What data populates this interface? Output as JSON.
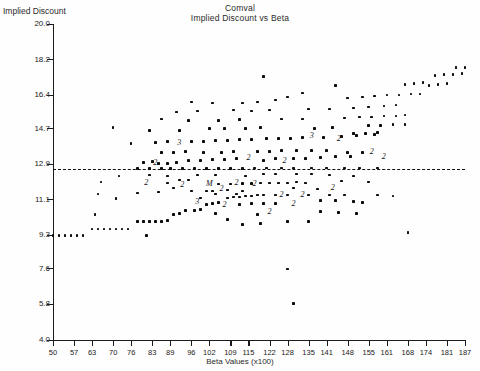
{
  "chart_data": {
    "type": "scatter",
    "title": "Comval",
    "subtitle": "Implied Discount vs Beta",
    "xlabel": "Beta Values (x100)",
    "ylabel": "Implied Discount",
    "xlim": [
      50,
      187
    ],
    "ylim": [
      4.0,
      20.0
    ],
    "grid": false,
    "legend": null,
    "xticks": [
      50,
      57,
      63,
      70,
      76,
      83,
      89,
      96,
      102,
      109,
      115,
      122,
      128,
      135,
      141,
      148,
      155,
      161,
      168,
      174,
      181,
      187
    ],
    "yticks": [
      "20.0",
      "18.2",
      "16.4",
      "14.7",
      "12.9",
      "11.1",
      "9.3",
      "7.6",
      "5.8",
      "4.0"
    ],
    "ytick_values": [
      20.0,
      18.2,
      16.4,
      14.7,
      12.9,
      11.1,
      9.3,
      7.6,
      5.8,
      4.0
    ],
    "reference_line": {
      "style": "dashed",
      "orientation": "horizontal",
      "y": 12.66
    },
    "overlap_markers": [
      {
        "x": 92,
        "y": 14.0,
        "label": "3"
      },
      {
        "x": 84,
        "y": 12.95,
        "label": "2"
      },
      {
        "x": 115,
        "y": 13.2,
        "label": "2"
      },
      {
        "x": 127,
        "y": 13.05,
        "label": "2"
      },
      {
        "x": 136,
        "y": 14.35,
        "label": "3"
      },
      {
        "x": 145,
        "y": 14.2,
        "label": "2"
      },
      {
        "x": 156,
        "y": 13.5,
        "label": "2"
      },
      {
        "x": 160,
        "y": 13.25,
        "label": "2"
      },
      {
        "x": 81,
        "y": 11.95,
        "label": "2"
      },
      {
        "x": 93,
        "y": 11.85,
        "label": "2"
      },
      {
        "x": 102,
        "y": 11.9,
        "label": "M"
      },
      {
        "x": 106,
        "y": 11.65,
        "label": "2"
      },
      {
        "x": 111,
        "y": 11.95,
        "label": "2"
      },
      {
        "x": 117,
        "y": 11.9,
        "label": "2"
      },
      {
        "x": 98,
        "y": 11.0,
        "label": "3"
      },
      {
        "x": 107,
        "y": 10.85,
        "label": "2"
      },
      {
        "x": 126,
        "y": 11.35,
        "label": "2"
      },
      {
        "x": 133,
        "y": 11.35,
        "label": "2"
      },
      {
        "x": 130,
        "y": 10.9,
        "label": "2"
      },
      {
        "x": 143,
        "y": 11.7,
        "label": "2"
      },
      {
        "x": 122,
        "y": 10.5,
        "label": "2"
      }
    ],
    "points": [
      {
        "x": 50,
        "y": 9.3
      },
      {
        "x": 52,
        "y": 9.3
      },
      {
        "x": 54,
        "y": 9.3
      },
      {
        "x": 56,
        "y": 9.3
      },
      {
        "x": 58,
        "y": 9.3
      },
      {
        "x": 60,
        "y": 9.3
      },
      {
        "x": 63,
        "y": 9.62
      },
      {
        "x": 65,
        "y": 9.62
      },
      {
        "x": 67,
        "y": 9.62
      },
      {
        "x": 69,
        "y": 9.62
      },
      {
        "x": 71,
        "y": 9.62
      },
      {
        "x": 73,
        "y": 9.62
      },
      {
        "x": 75,
        "y": 9.62
      },
      {
        "x": 78,
        "y": 10.0
      },
      {
        "x": 80,
        "y": 10.0
      },
      {
        "x": 82,
        "y": 10.0
      },
      {
        "x": 84,
        "y": 10.0
      },
      {
        "x": 86,
        "y": 10.0
      },
      {
        "x": 88,
        "y": 10.05
      },
      {
        "x": 81,
        "y": 9.3
      },
      {
        "x": 90,
        "y": 10.35
      },
      {
        "x": 92,
        "y": 10.4
      },
      {
        "x": 94,
        "y": 10.55
      },
      {
        "x": 97,
        "y": 10.55
      },
      {
        "x": 99,
        "y": 10.6
      },
      {
        "x": 101,
        "y": 10.85
      },
      {
        "x": 103,
        "y": 10.9
      },
      {
        "x": 105,
        "y": 10.95
      },
      {
        "x": 108,
        "y": 11.2
      },
      {
        "x": 110,
        "y": 11.25
      },
      {
        "x": 112,
        "y": 11.25
      },
      {
        "x": 114,
        "y": 11.3
      },
      {
        "x": 116,
        "y": 11.3
      },
      {
        "x": 118,
        "y": 11.35
      },
      {
        "x": 120,
        "y": 11.35
      },
      {
        "x": 104,
        "y": 11.4
      },
      {
        "x": 111,
        "y": 11.4
      },
      {
        "x": 71,
        "y": 11.15
      },
      {
        "x": 78,
        "y": 11.45
      },
      {
        "x": 96,
        "y": 11.55
      },
      {
        "x": 99,
        "y": 11.2
      },
      {
        "x": 88,
        "y": 11.95
      },
      {
        "x": 90,
        "y": 11.7
      },
      {
        "x": 101,
        "y": 11.55
      },
      {
        "x": 103,
        "y": 11.55
      },
      {
        "x": 108,
        "y": 11.6
      },
      {
        "x": 113,
        "y": 11.55
      },
      {
        "x": 105,
        "y": 11.9
      },
      {
        "x": 109,
        "y": 11.9
      },
      {
        "x": 113,
        "y": 11.92
      },
      {
        "x": 116,
        "y": 11.92
      },
      {
        "x": 119,
        "y": 11.95
      },
      {
        "x": 122,
        "y": 11.95
      },
      {
        "x": 125,
        "y": 11.95
      },
      {
        "x": 128,
        "y": 11.95
      },
      {
        "x": 131,
        "y": 12.0
      },
      {
        "x": 134,
        "y": 11.95
      },
      {
        "x": 138,
        "y": 11.65
      },
      {
        "x": 124,
        "y": 11.35
      },
      {
        "x": 128,
        "y": 11.35
      },
      {
        "x": 120,
        "y": 10.9
      },
      {
        "x": 124,
        "y": 10.9
      },
      {
        "x": 112,
        "y": 10.85
      },
      {
        "x": 116,
        "y": 10.9
      },
      {
        "x": 104,
        "y": 10.4
      },
      {
        "x": 130,
        "y": 11.7
      },
      {
        "x": 135,
        "y": 11.35
      },
      {
        "x": 142,
        "y": 11.35
      },
      {
        "x": 147,
        "y": 11.35
      },
      {
        "x": 139,
        "y": 11.05
      },
      {
        "x": 144,
        "y": 11.05
      },
      {
        "x": 150,
        "y": 11.0
      },
      {
        "x": 153,
        "y": 10.95
      },
      {
        "x": 118,
        "y": 10.35
      },
      {
        "x": 65,
        "y": 11.4
      },
      {
        "x": 85,
        "y": 11.5
      },
      {
        "x": 92,
        "y": 12.1
      },
      {
        "x": 95,
        "y": 12.1
      },
      {
        "x": 98,
        "y": 12.35
      },
      {
        "x": 78,
        "y": 12.68
      },
      {
        "x": 82,
        "y": 12.68
      },
      {
        "x": 86,
        "y": 12.68
      },
      {
        "x": 89,
        "y": 12.68
      },
      {
        "x": 93,
        "y": 12.68
      },
      {
        "x": 97,
        "y": 12.68
      },
      {
        "x": 101,
        "y": 12.68
      },
      {
        "x": 105,
        "y": 12.68
      },
      {
        "x": 109,
        "y": 12.68
      },
      {
        "x": 113,
        "y": 12.68
      },
      {
        "x": 117,
        "y": 12.7
      },
      {
        "x": 121,
        "y": 12.7
      },
      {
        "x": 126,
        "y": 12.7
      },
      {
        "x": 130,
        "y": 12.7
      },
      {
        "x": 136,
        "y": 12.7
      },
      {
        "x": 141,
        "y": 12.7
      },
      {
        "x": 147,
        "y": 12.7
      },
      {
        "x": 152,
        "y": 12.7
      },
      {
        "x": 158,
        "y": 12.7
      },
      {
        "x": 85,
        "y": 12.95
      },
      {
        "x": 88,
        "y": 12.95
      },
      {
        "x": 91,
        "y": 13.0
      },
      {
        "x": 80,
        "y": 13.0
      },
      {
        "x": 83,
        "y": 13.05
      },
      {
        "x": 95,
        "y": 13.1
      },
      {
        "x": 99,
        "y": 13.1
      },
      {
        "x": 103,
        "y": 13.15
      },
      {
        "x": 107,
        "y": 13.15
      },
      {
        "x": 111,
        "y": 13.2
      },
      {
        "x": 120,
        "y": 13.1
      },
      {
        "x": 124,
        "y": 13.2
      },
      {
        "x": 130,
        "y": 13.2
      },
      {
        "x": 134,
        "y": 13.2
      },
      {
        "x": 139,
        "y": 13.25
      },
      {
        "x": 144,
        "y": 13.3
      },
      {
        "x": 149,
        "y": 13.3
      },
      {
        "x": 118,
        "y": 13.55
      },
      {
        "x": 122,
        "y": 13.55
      },
      {
        "x": 126,
        "y": 13.6
      },
      {
        "x": 131,
        "y": 13.6
      },
      {
        "x": 136,
        "y": 13.6
      },
      {
        "x": 141,
        "y": 13.6
      },
      {
        "x": 86,
        "y": 13.5
      },
      {
        "x": 90,
        "y": 13.5
      },
      {
        "x": 94,
        "y": 13.55
      },
      {
        "x": 100,
        "y": 13.5
      },
      {
        "x": 106,
        "y": 13.5
      },
      {
        "x": 110,
        "y": 13.55
      },
      {
        "x": 148,
        "y": 13.5
      },
      {
        "x": 153,
        "y": 13.5
      },
      {
        "x": 76,
        "y": 13.95
      },
      {
        "x": 84,
        "y": 14.0
      },
      {
        "x": 88,
        "y": 14.05
      },
      {
        "x": 96,
        "y": 14.05
      },
      {
        "x": 100,
        "y": 14.05
      },
      {
        "x": 104,
        "y": 14.1
      },
      {
        "x": 108,
        "y": 14.1
      },
      {
        "x": 112,
        "y": 14.15
      },
      {
        "x": 116,
        "y": 14.15
      },
      {
        "x": 121,
        "y": 14.2
      },
      {
        "x": 125,
        "y": 14.2
      },
      {
        "x": 129,
        "y": 14.2
      },
      {
        "x": 133,
        "y": 14.25
      },
      {
        "x": 140,
        "y": 14.25
      },
      {
        "x": 146,
        "y": 14.3
      },
      {
        "x": 151,
        "y": 14.35
      },
      {
        "x": 157,
        "y": 14.4
      },
      {
        "x": 82,
        "y": 14.6
      },
      {
        "x": 92,
        "y": 14.6
      },
      {
        "x": 102,
        "y": 14.7
      },
      {
        "x": 107,
        "y": 14.7
      },
      {
        "x": 114,
        "y": 14.7
      },
      {
        "x": 119,
        "y": 14.75
      },
      {
        "x": 137,
        "y": 14.7
      },
      {
        "x": 143,
        "y": 14.75
      },
      {
        "x": 70,
        "y": 14.75
      },
      {
        "x": 95,
        "y": 15.1
      },
      {
        "x": 105,
        "y": 15.1
      },
      {
        "x": 112,
        "y": 15.15
      },
      {
        "x": 126,
        "y": 15.2
      },
      {
        "x": 133,
        "y": 15.2
      },
      {
        "x": 147,
        "y": 15.25
      },
      {
        "x": 98,
        "y": 15.6
      },
      {
        "x": 110,
        "y": 15.65
      },
      {
        "x": 116,
        "y": 15.6
      },
      {
        "x": 122,
        "y": 15.65
      },
      {
        "x": 135,
        "y": 15.7
      },
      {
        "x": 142,
        "y": 15.7
      },
      {
        "x": 150,
        "y": 15.75
      },
      {
        "x": 155,
        "y": 15.8
      },
      {
        "x": 128,
        "y": 16.3
      },
      {
        "x": 148,
        "y": 16.25
      },
      {
        "x": 153,
        "y": 16.3
      },
      {
        "x": 157,
        "y": 16.35
      },
      {
        "x": 161,
        "y": 16.4
      },
      {
        "x": 165,
        "y": 16.4
      },
      {
        "x": 160,
        "y": 15.85
      },
      {
        "x": 164,
        "y": 15.9
      },
      {
        "x": 152,
        "y": 15.3
      },
      {
        "x": 156,
        "y": 15.3
      },
      {
        "x": 160,
        "y": 15.35
      },
      {
        "x": 164,
        "y": 15.35
      },
      {
        "x": 167,
        "y": 15.4
      },
      {
        "x": 155,
        "y": 14.85
      },
      {
        "x": 159,
        "y": 14.85
      },
      {
        "x": 163,
        "y": 14.9
      },
      {
        "x": 167,
        "y": 14.9
      },
      {
        "x": 150,
        "y": 14.45
      },
      {
        "x": 154,
        "y": 14.45
      },
      {
        "x": 158,
        "y": 14.5
      },
      {
        "x": 169,
        "y": 16.45
      },
      {
        "x": 172,
        "y": 16.45
      },
      {
        "x": 175,
        "y": 16.9
      },
      {
        "x": 178,
        "y": 16.95
      },
      {
        "x": 181,
        "y": 17.0
      },
      {
        "x": 170,
        "y": 17.0
      },
      {
        "x": 173,
        "y": 17.05
      },
      {
        "x": 177,
        "y": 17.4
      },
      {
        "x": 180,
        "y": 17.45
      },
      {
        "x": 183,
        "y": 17.45
      },
      {
        "x": 186,
        "y": 17.5
      },
      {
        "x": 184,
        "y": 17.8
      },
      {
        "x": 187,
        "y": 17.8
      },
      {
        "x": 167,
        "y": 16.95
      },
      {
        "x": 144,
        "y": 16.9
      },
      {
        "x": 120,
        "y": 17.35
      },
      {
        "x": 133,
        "y": 16.5
      },
      {
        "x": 113,
        "y": 16.0
      },
      {
        "x": 118,
        "y": 16.05
      },
      {
        "x": 124,
        "y": 16.15
      },
      {
        "x": 91,
        "y": 15.55
      },
      {
        "x": 86,
        "y": 15.2
      },
      {
        "x": 96,
        "y": 16.05
      },
      {
        "x": 103,
        "y": 16.0
      },
      {
        "x": 82,
        "y": 12.35
      },
      {
        "x": 88,
        "y": 12.3
      },
      {
        "x": 104,
        "y": 12.35
      },
      {
        "x": 114,
        "y": 12.3
      },
      {
        "x": 120,
        "y": 12.4
      },
      {
        "x": 124,
        "y": 12.4
      },
      {
        "x": 131,
        "y": 12.4
      },
      {
        "x": 136,
        "y": 12.4
      },
      {
        "x": 142,
        "y": 12.35
      },
      {
        "x": 72,
        "y": 12.3
      },
      {
        "x": 66,
        "y": 12.0
      },
      {
        "x": 150,
        "y": 12.3
      },
      {
        "x": 146,
        "y": 12.05
      },
      {
        "x": 155,
        "y": 12.0
      },
      {
        "x": 139,
        "y": 10.5
      },
      {
        "x": 145,
        "y": 10.45
      },
      {
        "x": 151,
        "y": 10.4
      },
      {
        "x": 158,
        "y": 11.35
      },
      {
        "x": 163,
        "y": 11.3
      },
      {
        "x": 128,
        "y": 10.0
      },
      {
        "x": 135,
        "y": 10.0
      },
      {
        "x": 108,
        "y": 10.1
      },
      {
        "x": 128,
        "y": 7.6
      },
      {
        "x": 130,
        "y": 5.85
      },
      {
        "x": 168,
        "y": 9.45
      },
      {
        "x": 113,
        "y": 9.85
      },
      {
        "x": 119,
        "y": 9.9
      },
      {
        "x": 64,
        "y": 10.35
      }
    ]
  }
}
